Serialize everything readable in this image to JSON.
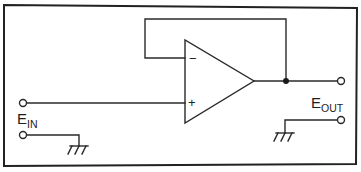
{
  "diagram": {
    "type": "circuit-schematic",
    "opamp": {
      "inverting_input_sign": "−",
      "noninverting_input_sign": "+"
    },
    "labels": {
      "input": {
        "main": "E",
        "sub": "IN"
      },
      "output": {
        "main": "E",
        "sub": "OUT"
      }
    },
    "components": [
      "op-amp",
      "feedback-wire",
      "input-terminal-signal",
      "input-terminal-ground",
      "output-terminal-signal",
      "output-terminal-ground",
      "ground-symbol-in",
      "ground-symbol-out",
      "junction-node"
    ],
    "colors": {
      "ink": "#2a2a2a",
      "background": "#ffffff"
    }
  }
}
